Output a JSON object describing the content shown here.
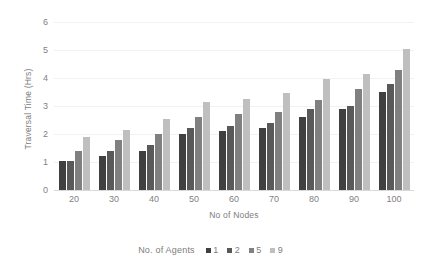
{
  "chart_data": {
    "type": "bar",
    "title": "",
    "xlabel": "No of Nodes",
    "ylabel": "Traversal Time (Hrs)",
    "categories": [
      "20",
      "30",
      "40",
      "50",
      "60",
      "70",
      "80",
      "90",
      "100"
    ],
    "ylim": [
      0,
      6
    ],
    "yticks": [
      "0",
      "1",
      "2",
      "3",
      "4",
      "5",
      "6"
    ],
    "grid": true,
    "legend_position": "bottom",
    "legend_title": "No. of Agents",
    "series": [
      {
        "name": "1",
        "color": "#404040",
        "values": [
          1.05,
          1.2,
          1.4,
          2.0,
          2.1,
          2.2,
          2.6,
          2.9,
          3.5
        ]
      },
      {
        "name": "2",
        "color": "#595959",
        "values": [
          1.05,
          1.4,
          1.6,
          2.2,
          2.3,
          2.4,
          2.9,
          3.0,
          3.8
        ]
      },
      {
        "name": "5",
        "color": "#808080",
        "values": [
          1.4,
          1.8,
          2.0,
          2.6,
          2.7,
          2.8,
          3.2,
          3.6,
          4.3
        ]
      },
      {
        "name": "9",
        "color": "#bfbfbf",
        "values": [
          1.9,
          2.15,
          2.55,
          3.15,
          3.25,
          3.45,
          3.95,
          4.15,
          5.05
        ]
      }
    ]
  }
}
